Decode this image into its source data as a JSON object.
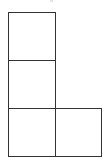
{
  "diagram": {
    "type": "grid-polyomino",
    "stroke_color": "#333333",
    "background_color": "#ffffff",
    "cells": [
      {
        "id": "cell-r1-c1",
        "row": 1,
        "col": 1,
        "x": 8,
        "y": 12,
        "w": 48,
        "h": 49
      },
      {
        "id": "cell-r2-c1",
        "row": 2,
        "col": 1,
        "x": 8,
        "y": 60,
        "w": 48,
        "h": 49
      },
      {
        "id": "cell-r3-c1",
        "row": 3,
        "col": 1,
        "x": 8,
        "y": 108,
        "w": 48,
        "h": 49
      },
      {
        "id": "cell-r3-c2",
        "row": 3,
        "col": 2,
        "x": 55,
        "y": 108,
        "w": 47,
        "h": 49
      }
    ]
  }
}
